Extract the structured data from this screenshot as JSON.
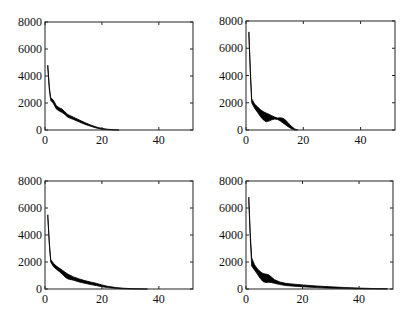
{
  "chart_data": [
    {
      "type": "area",
      "panel": "top-left",
      "title": "",
      "xlabel": "",
      "ylabel": "",
      "xlim": [
        0,
        52
      ],
      "ylim": [
        0,
        8000
      ],
      "xticks": [
        0,
        20,
        40
      ],
      "yticks": [
        0,
        2000,
        4000,
        6000,
        8000
      ],
      "grid": false,
      "legend": null,
      "box": {
        "left": 45,
        "top": 22,
        "right": 193,
        "bottom": 130
      },
      "series": [
        {
          "name": "upper",
          "x": [
            1,
            1.5,
            2,
            3,
            4,
            5,
            6,
            7,
            8,
            10,
            12,
            14,
            16,
            18,
            20,
            22,
            24,
            26
          ],
          "values": [
            4800,
            3200,
            2400,
            2200,
            1800,
            1650,
            1550,
            1350,
            1150,
            950,
            750,
            550,
            380,
            230,
            120,
            60,
            20,
            0
          ]
        },
        {
          "name": "lower",
          "x": [
            1,
            1.5,
            2,
            3,
            4,
            5,
            6,
            7,
            8,
            10,
            12,
            14,
            16,
            18,
            20,
            22,
            24,
            26
          ],
          "values": [
            4600,
            3000,
            2200,
            1950,
            1550,
            1400,
            1300,
            1150,
            950,
            780,
            600,
            420,
            280,
            150,
            60,
            20,
            0,
            0
          ]
        }
      ]
    },
    {
      "type": "area",
      "panel": "top-right",
      "title": "",
      "xlabel": "",
      "ylabel": "",
      "xlim": [
        0,
        52
      ],
      "ylim": [
        0,
        8000
      ],
      "xticks": [
        0,
        20,
        40
      ],
      "yticks": [
        0,
        2000,
        4000,
        6000,
        8000
      ],
      "grid": false,
      "legend": null,
      "box": {
        "left": 246,
        "top": 21,
        "right": 395,
        "bottom": 130
      },
      "series": [
        {
          "name": "upper",
          "x": [
            1,
            1.5,
            2,
            3,
            4,
            5,
            6,
            7,
            8,
            9,
            10,
            11,
            12,
            13,
            14,
            15,
            16,
            17,
            18
          ],
          "values": [
            7200,
            4500,
            2300,
            1900,
            1700,
            1500,
            1350,
            1250,
            1150,
            1050,
            950,
            880,
            900,
            850,
            700,
            450,
            250,
            80,
            0
          ]
        },
        {
          "name": "lower",
          "x": [
            1,
            1.5,
            2,
            3,
            4,
            5,
            6,
            7,
            8,
            9,
            10,
            11,
            12,
            13,
            14,
            15,
            16,
            17,
            18
          ],
          "values": [
            6900,
            4200,
            2000,
            1600,
            1300,
            1000,
            750,
            600,
            650,
            750,
            800,
            780,
            650,
            500,
            350,
            200,
            80,
            0,
            0
          ]
        }
      ]
    },
    {
      "type": "area",
      "panel": "bottom-left",
      "title": "",
      "xlabel": "",
      "ylabel": "",
      "xlim": [
        0,
        52
      ],
      "ylim": [
        0,
        8000
      ],
      "xticks": [
        0,
        20,
        40
      ],
      "yticks": [
        0,
        2000,
        4000,
        6000,
        8000
      ],
      "grid": false,
      "legend": null,
      "box": {
        "left": 45,
        "top": 181,
        "right": 193,
        "bottom": 289
      },
      "series": [
        {
          "name": "upper",
          "x": [
            1,
            1.5,
            2,
            3,
            4,
            5,
            6,
            7,
            8,
            10,
            12,
            14,
            16,
            18,
            20,
            22,
            25,
            28,
            32,
            36
          ],
          "values": [
            5500,
            3500,
            2200,
            1900,
            1700,
            1550,
            1400,
            1250,
            1100,
            900,
            750,
            620,
            520,
            420,
            300,
            200,
            100,
            50,
            15,
            0
          ]
        },
        {
          "name": "lower",
          "x": [
            1,
            1.5,
            2,
            3,
            4,
            5,
            6,
            7,
            8,
            10,
            12,
            14,
            16,
            18,
            20,
            22,
            25,
            28,
            32,
            36
          ],
          "values": [
            5300,
            3300,
            2000,
            1650,
            1450,
            1300,
            1100,
            900,
            750,
            650,
            520,
            420,
            330,
            250,
            170,
            100,
            40,
            10,
            0,
            0
          ]
        }
      ]
    },
    {
      "type": "area",
      "panel": "bottom-right",
      "title": "",
      "xlabel": "",
      "ylabel": "",
      "xlim": [
        0,
        52
      ],
      "ylim": [
        0,
        8000
      ],
      "xticks": [
        0,
        20,
        40
      ],
      "yticks": [
        0,
        2000,
        4000,
        6000,
        8000
      ],
      "grid": false,
      "legend": null,
      "box": {
        "left": 246,
        "top": 181,
        "right": 393,
        "bottom": 289
      },
      "series": [
        {
          "name": "upper",
          "x": [
            1,
            1.5,
            2,
            3,
            4,
            5,
            6,
            7,
            8,
            9,
            10,
            12,
            14,
            16,
            20,
            25,
            30,
            35,
            40,
            45,
            50
          ],
          "values": [
            6800,
            4200,
            2300,
            1800,
            1500,
            1300,
            1150,
            1100,
            1050,
            900,
            700,
            520,
            420,
            380,
            300,
            220,
            160,
            110,
            70,
            40,
            20
          ]
        },
        {
          "name": "lower",
          "x": [
            1,
            1.5,
            2,
            3,
            4,
            5,
            6,
            7,
            8,
            9,
            10,
            12,
            14,
            16,
            20,
            25,
            30,
            35,
            40,
            45,
            50
          ],
          "values": [
            6500,
            3900,
            1700,
            1400,
            1100,
            800,
            550,
            480,
            500,
            480,
            420,
            330,
            260,
            220,
            160,
            100,
            60,
            30,
            10,
            0,
            0
          ]
        }
      ]
    }
  ]
}
